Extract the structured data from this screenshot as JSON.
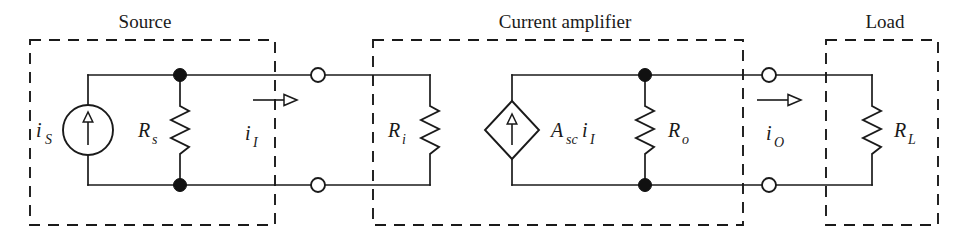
{
  "figure": {
    "kind": "circuit-diagram",
    "background_color": "#ffffff",
    "line_color": "#1a1a1a"
  },
  "sections": [
    {
      "id": "source",
      "title": "Source",
      "title_x": 145,
      "box": {
        "x": 30,
        "y": 40,
        "w": 245,
        "h": 185
      }
    },
    {
      "id": "current-amplifier",
      "title": "Current amplifier",
      "title_x": 565,
      "box": {
        "x": 373,
        "y": 40,
        "w": 370,
        "h": 185
      }
    },
    {
      "id": "load",
      "title": "Load",
      "title_x": 885,
      "box": {
        "x": 826,
        "y": 40,
        "w": 112,
        "h": 185
      }
    }
  ],
  "labels": {
    "source_current": {
      "base": "i",
      "sub": "S",
      "x": 36,
      "y": 137
    },
    "source_resistance": {
      "base": "R",
      "sub": "s",
      "x": 140,
      "y": 137
    },
    "input_current": {
      "base": "i",
      "sub": "I",
      "x": 245,
      "y": 140
    },
    "input_resistance": {
      "base": "R",
      "sub": "i",
      "x": 390,
      "y": 137
    },
    "dependent_source": {
      "base": "A",
      "sub": "sc",
      "base2": "i",
      "sub2": "I",
      "x": 553,
      "y": 137
    },
    "output_resistance": {
      "base": "R",
      "sub": "o",
      "x": 670,
      "y": 137
    },
    "output_current": {
      "base": "i",
      "sub": "O",
      "x": 768,
      "y": 140
    },
    "load_resistance": {
      "base": "R",
      "sub": "L",
      "x": 896,
      "y": 137
    }
  },
  "components": {
    "independent_current_source": {
      "type": "circle-with-arrow",
      "cx": 88,
      "cy": 130,
      "r": 25,
      "direction": "up"
    },
    "dependent_current_source": {
      "type": "diamond-with-arrow",
      "cx": 512,
      "cy": 130,
      "rx": 27,
      "ry": 29,
      "direction": "up"
    },
    "resistors": [
      {
        "name": "Rs",
        "x": 180,
        "y_top": 75,
        "y_bottom": 185
      },
      {
        "name": "Ri",
        "x": 430,
        "y_top": 75,
        "y_bottom": 185
      },
      {
        "name": "Ro",
        "x": 645,
        "y_top": 75,
        "y_bottom": 185
      },
      {
        "name": "RL",
        "x": 872,
        "y_top": 75,
        "y_bottom": 185
      }
    ]
  },
  "nodes": {
    "filled_dots": [
      {
        "x": 180,
        "y": 75
      },
      {
        "x": 180,
        "y": 185
      },
      {
        "x": 645,
        "y": 75
      },
      {
        "x": 645,
        "y": 185
      }
    ],
    "open_terminals": [
      {
        "x": 318,
        "y": 75
      },
      {
        "x": 318,
        "y": 185
      },
      {
        "x": 769,
        "y": 75
      },
      {
        "x": 769,
        "y": 185
      }
    ]
  },
  "current_arrows": [
    {
      "name": "iI",
      "x1": 253,
      "x2": 293,
      "y": 100,
      "direction": "right"
    },
    {
      "name": "iO",
      "x1": 757,
      "x2": 797,
      "y": 100,
      "direction": "right"
    }
  ]
}
